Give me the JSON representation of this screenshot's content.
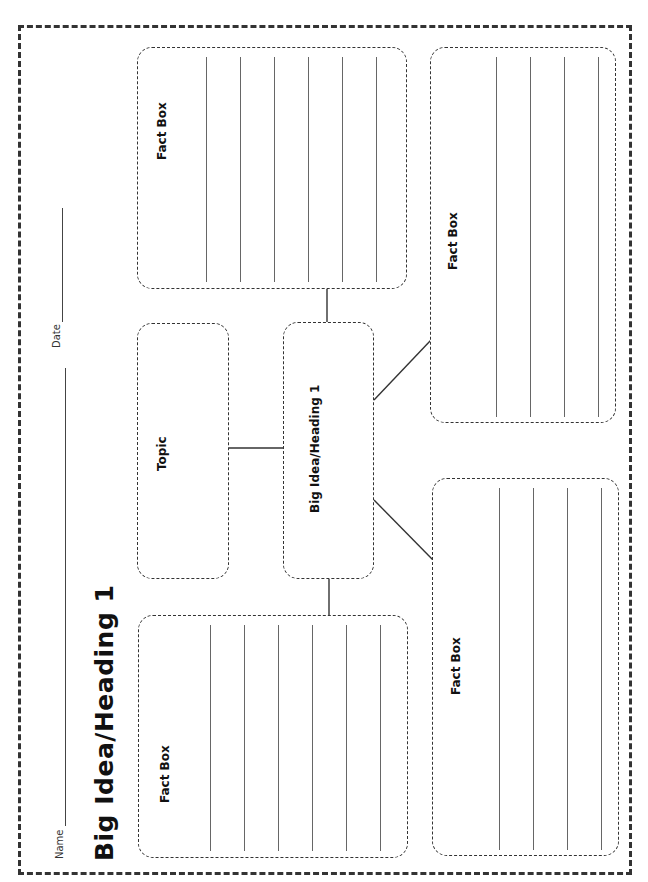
{
  "worksheet": {
    "title": "Big Idea/Heading 1",
    "name_label": "Name",
    "date_label": "Date",
    "topic_box": {
      "label": "Topic"
    },
    "big_idea_box": {
      "label": "Big Idea/Heading 1"
    },
    "fact_boxes": [
      {
        "position": "top-left",
        "label": "Fact Box",
        "lines": 6
      },
      {
        "position": "bottom-left",
        "label": "Fact Box",
        "lines": 6
      },
      {
        "position": "top-right",
        "label": "Fact Box",
        "lines": 4
      },
      {
        "position": "bottom-right",
        "label": "Fact Box",
        "lines": 4
      }
    ],
    "orientation": "rotated 90° counter-clockwise",
    "colors": {
      "ink": "#333333",
      "background": "#ffffff"
    }
  }
}
